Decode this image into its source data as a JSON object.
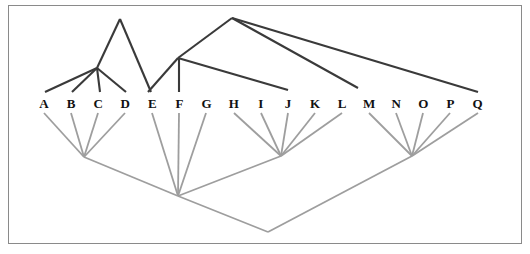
{
  "figure": {
    "background_color": "#ffffff",
    "frame_color": "#8a8a8a",
    "upper_tree_color": "#3a3a3a",
    "lower_tree_color": "#9e9e9e",
    "label_color": "#111111"
  },
  "taxa": {
    "labels": [
      "A",
      "B",
      "C",
      "D",
      "E",
      "F",
      "G",
      "H",
      "I",
      "J",
      "K",
      "L",
      "M",
      "N",
      "O",
      "P",
      "Q"
    ],
    "baseline_y": 103,
    "first_x": 44,
    "spacing_x": 27.1
  },
  "chart_data": {
    "type": "diagram",
    "subtype": "phylogenetic-tree-pair",
    "xlabel": "",
    "ylabel": "",
    "grid": false,
    "legend": "none",
    "leaves": [
      {
        "id": "A",
        "x": 44,
        "y": 103
      },
      {
        "id": "B",
        "x": 71.1,
        "y": 103
      },
      {
        "id": "C",
        "x": 98.2,
        "y": 103
      },
      {
        "id": "D",
        "x": 125.3,
        "y": 103
      },
      {
        "id": "E",
        "x": 152.4,
        "y": 103
      },
      {
        "id": "F",
        "x": 179.5,
        "y": 103
      },
      {
        "id": "G",
        "x": 206.6,
        "y": 103
      },
      {
        "id": "H",
        "x": 233.7,
        "y": 103
      },
      {
        "id": "I",
        "x": 260.8,
        "y": 103
      },
      {
        "id": "J",
        "x": 287.9,
        "y": 103
      },
      {
        "id": "K",
        "x": 315.0,
        "y": 103
      },
      {
        "id": "L",
        "x": 342.1,
        "y": 103
      },
      {
        "id": "M",
        "x": 369.2,
        "y": 103
      },
      {
        "id": "N",
        "x": 396.3,
        "y": 103
      },
      {
        "id": "O",
        "x": 423.4,
        "y": 103
      },
      {
        "id": "P",
        "x": 450.5,
        "y": 103
      },
      {
        "id": "Q",
        "x": 477.6,
        "y": 103
      }
    ],
    "upper_tree": {
      "name": "upper-tree",
      "color": "#3a3a3a",
      "stroke_width": 2.1,
      "nodes": [
        {
          "id": "u-apex-left",
          "x": 120,
          "y": 19
        },
        {
          "id": "u-node-abcd",
          "x": 97,
          "y": 68
        },
        {
          "id": "u-apex-right",
          "x": 232,
          "y": 18
        },
        {
          "id": "u-node-ef",
          "x": 178,
          "y": 58
        }
      ],
      "edges": [
        {
          "from": "u-apex-left",
          "to": "u-node-abcd",
          "x1": 120,
          "y1": 19,
          "x2": 97,
          "y2": 68
        },
        {
          "from": "u-node-abcd",
          "to": "A",
          "x1": 97,
          "y1": 68,
          "x2": 45,
          "y2": 92
        },
        {
          "from": "u-node-abcd",
          "to": "B",
          "x1": 97,
          "y1": 68,
          "x2": 72,
          "y2": 92
        },
        {
          "from": "u-node-abcd",
          "to": "C",
          "x1": 97,
          "y1": 68,
          "x2": 100,
          "y2": 92
        },
        {
          "from": "u-node-abcd",
          "to": "D",
          "x1": 97,
          "y1": 68,
          "x2": 126,
          "y2": 92
        },
        {
          "from": "u-apex-left",
          "to": "cross-right",
          "x1": 120,
          "y1": 19,
          "x2": 151,
          "y2": 92
        },
        {
          "from": "u-apex-right",
          "to": "u-node-ef",
          "x1": 232,
          "y1": 18,
          "x2": 178,
          "y2": 58
        },
        {
          "from": "u-node-ef",
          "to": "E",
          "x1": 178,
          "y1": 58,
          "x2": 148,
          "y2": 92
        },
        {
          "from": "u-node-ef",
          "to": "F",
          "x1": 179,
          "y1": 58,
          "x2": 179,
          "y2": 92
        },
        {
          "from": "u-node-ef",
          "to": "J",
          "x1": 178,
          "y1": 58,
          "x2": 288,
          "y2": 90
        },
        {
          "from": "u-apex-right",
          "to": "M",
          "x1": 232,
          "y1": 18,
          "x2": 358,
          "y2": 88
        },
        {
          "from": "u-apex-right",
          "to": "Q",
          "x1": 232,
          "y1": 18,
          "x2": 478,
          "y2": 92
        }
      ]
    },
    "lower_tree": {
      "name": "lower-tree",
      "color": "#9e9e9e",
      "stroke_width": 1.8,
      "nodes": [
        {
          "id": "l-node-abcd",
          "x": 84,
          "y": 157
        },
        {
          "id": "l-node-efg",
          "x": 178,
          "y": 196
        },
        {
          "id": "l-node-hijkl",
          "x": 281,
          "y": 156
        },
        {
          "id": "l-node-mnopq",
          "x": 412,
          "y": 156
        },
        {
          "id": "l-root",
          "x": 268,
          "y": 232
        }
      ],
      "edges": [
        {
          "from": "A",
          "to": "l-node-abcd",
          "x1": 44,
          "y1": 113,
          "x2": 84,
          "y2": 157
        },
        {
          "from": "B",
          "to": "l-node-abcd",
          "x1": 71,
          "y1": 113,
          "x2": 84,
          "y2": 157
        },
        {
          "from": "C",
          "to": "l-node-abcd",
          "x1": 98,
          "y1": 113,
          "x2": 84,
          "y2": 157
        },
        {
          "from": "D",
          "to": "l-node-abcd",
          "x1": 125,
          "y1": 113,
          "x2": 84,
          "y2": 157
        },
        {
          "from": "E",
          "to": "l-node-efg",
          "x1": 152,
          "y1": 113,
          "x2": 178,
          "y2": 196
        },
        {
          "from": "F",
          "to": "l-node-efg",
          "x1": 179,
          "y1": 113,
          "x2": 178,
          "y2": 196
        },
        {
          "from": "G",
          "to": "l-node-efg",
          "x1": 206,
          "y1": 113,
          "x2": 178,
          "y2": 196
        },
        {
          "from": "H",
          "to": "l-node-hijkl",
          "x1": 234,
          "y1": 113,
          "x2": 281,
          "y2": 156
        },
        {
          "from": "I",
          "to": "l-node-hijkl",
          "x1": 261,
          "y1": 113,
          "x2": 281,
          "y2": 156
        },
        {
          "from": "J",
          "to": "l-node-hijkl",
          "x1": 288,
          "y1": 113,
          "x2": 281,
          "y2": 156
        },
        {
          "from": "K",
          "to": "l-node-hijkl",
          "x1": 315,
          "y1": 113,
          "x2": 281,
          "y2": 156
        },
        {
          "from": "L",
          "to": "l-node-hijkl",
          "x1": 342,
          "y1": 113,
          "x2": 281,
          "y2": 156
        },
        {
          "from": "M",
          "to": "l-node-mnopq",
          "x1": 369,
          "y1": 113,
          "x2": 412,
          "y2": 156
        },
        {
          "from": "N",
          "to": "l-node-mnopq",
          "x1": 396,
          "y1": 113,
          "x2": 412,
          "y2": 156
        },
        {
          "from": "O",
          "to": "l-node-mnopq",
          "x1": 423,
          "y1": 113,
          "x2": 412,
          "y2": 156
        },
        {
          "from": "P",
          "to": "l-node-mnopq",
          "x1": 450,
          "y1": 113,
          "x2": 412,
          "y2": 156
        },
        {
          "from": "Q",
          "to": "l-node-mnopq",
          "x1": 478,
          "y1": 113,
          "x2": 412,
          "y2": 156
        },
        {
          "from": "l-node-abcd",
          "to": "l-node-efg",
          "x1": 84,
          "y1": 157,
          "x2": 178,
          "y2": 196
        },
        {
          "from": "l-node-hijkl",
          "to": "l-node-efg",
          "x1": 281,
          "y1": 156,
          "x2": 178,
          "y2": 196
        },
        {
          "from": "l-node-efg",
          "to": "l-root",
          "x1": 178,
          "y1": 196,
          "x2": 268,
          "y2": 232
        },
        {
          "from": "l-node-mnopq",
          "to": "l-root",
          "x1": 412,
          "y1": 156,
          "x2": 268,
          "y2": 232
        }
      ]
    }
  }
}
